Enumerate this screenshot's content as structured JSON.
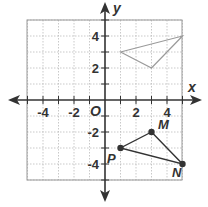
{
  "diagram": {
    "type": "coordinate-plane",
    "x_axis": {
      "label": "x",
      "range": [
        -5,
        5
      ],
      "tick_labels": [
        "-4",
        "-2",
        "2",
        "4"
      ],
      "tick_values": [
        -4,
        -2,
        2,
        4
      ]
    },
    "y_axis": {
      "label": "y",
      "range": [
        -5,
        5
      ],
      "tick_labels": [
        "4",
        "2",
        "-2",
        "-4"
      ],
      "tick_values": [
        4,
        2,
        -2,
        -4
      ]
    },
    "origin_label": "O",
    "grid": {
      "on": true,
      "step": 1,
      "style": "dotted"
    },
    "colors": {
      "axis": "#333333",
      "grid": "#bbbbbb",
      "border": "#999999",
      "preimage": "#333333",
      "image": "#9a9a9a"
    },
    "triangles": [
      {
        "name": "MNP",
        "role": "preimage",
        "vertices": [
          {
            "label": "M",
            "x": 3,
            "y": -2
          },
          {
            "label": "N",
            "x": 5,
            "y": -4
          },
          {
            "label": "P",
            "x": 1,
            "y": -3
          }
        ]
      },
      {
        "name": "image",
        "role": "image",
        "vertices": [
          {
            "label": "",
            "x": 1,
            "y": 3
          },
          {
            "label": "",
            "x": 5,
            "y": 4
          },
          {
            "label": "",
            "x": 3,
            "y": 2
          }
        ]
      }
    ]
  }
}
